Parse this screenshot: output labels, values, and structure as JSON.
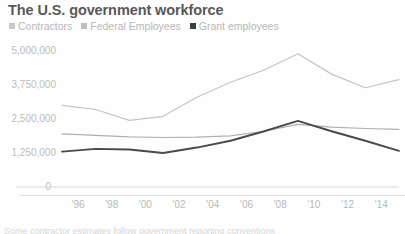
{
  "header": {
    "title": "The U.S. government workforce"
  },
  "legend": {
    "position": "top-left",
    "items": [
      {
        "label": "Contractors",
        "color": "#c9c9c9",
        "icon": "square-swatch-icon"
      },
      {
        "label": "Federal Employees",
        "color": "#bdbdbd",
        "icon": "square-swatch-icon"
      },
      {
        "label": "Grant employees",
        "color": "#3d3d3d",
        "icon": "square-swatch-icon"
      }
    ]
  },
  "axes": {
    "y_ticks": [
      "0",
      "1,250,000",
      "2,500,000",
      "3,750,000",
      "5,000,000"
    ],
    "x_ticks": [
      "'96",
      "'98",
      "'00",
      "'02",
      "'04",
      "'06",
      "'08",
      "'10",
      "'12",
      "'14",
      "'16"
    ]
  },
  "bottom_caption": {
    "text": "Some contractor estimates follow government reporting conventions"
  },
  "chart_data": {
    "type": "line",
    "title": "The U.S. government workforce",
    "xlabel": "",
    "ylabel": "",
    "x": [
      "'96",
      "'98",
      "'00",
      "'02",
      "'04",
      "'06",
      "'08",
      "'10",
      "'12",
      "'14",
      "'16"
    ],
    "xtick_labels": [
      "'96",
      "'98",
      "'00",
      "'02",
      "'04",
      "'06",
      "'08",
      "'10",
      "'12",
      "'14",
      "'16"
    ],
    "ytick_labels": [
      "0",
      "1,250,000",
      "2,500,000",
      "3,750,000",
      "5,000,000"
    ],
    "ytick_values": [
      0,
      1250000,
      2500000,
      3750000,
      5000000
    ],
    "ylim": [
      0,
      5000000
    ],
    "grid": false,
    "legend_position": "top-left",
    "series": [
      {
        "name": "Contractors",
        "color": "#c4c4c4",
        "values": [
          3000000,
          2850000,
          2450000,
          2600000,
          3300000,
          3850000,
          4300000,
          4900000,
          4150000,
          3650000,
          3950000
        ]
      },
      {
        "name": "Federal Employees",
        "color": "#b0b0b0",
        "values": [
          1950000,
          1900000,
          1840000,
          1820000,
          1830000,
          1880000,
          2050000,
          2300000,
          2200000,
          2150000,
          2120000
        ]
      },
      {
        "name": "Grant employees",
        "color": "#4a4a4a",
        "values": [
          1300000,
          1400000,
          1380000,
          1250000,
          1450000,
          1700000,
          2050000,
          2430000,
          2050000,
          1700000,
          1330000
        ]
      }
    ]
  }
}
